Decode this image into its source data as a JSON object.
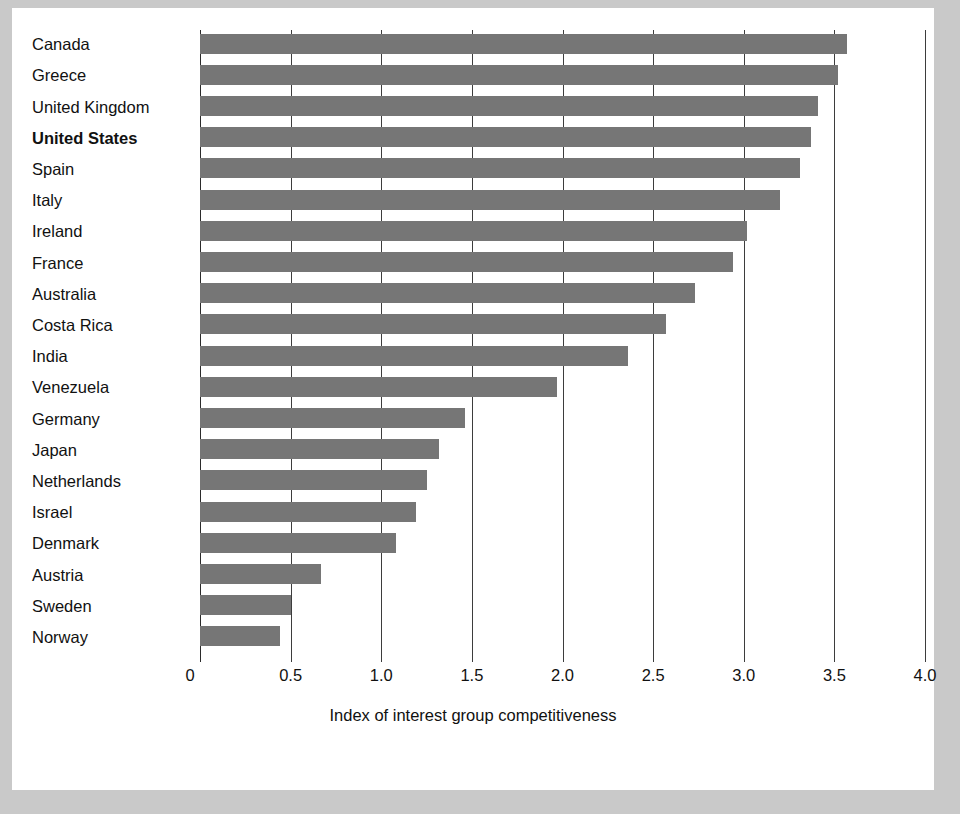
{
  "figure": {
    "background": "#ffffff",
    "page_background": "#c9c9c9",
    "bar_color": "#767676",
    "axis_color": "#2b2b2b",
    "highlight_label": "United States"
  },
  "chart_data": {
    "type": "bar",
    "orientation": "horizontal",
    "title": "",
    "subtitle": "",
    "xlabel": "Index of interest group competitiveness",
    "ylabel": "",
    "xlim": [
      0,
      4.0
    ],
    "xticks": [
      0,
      0.5,
      1.0,
      1.5,
      2.0,
      2.5,
      3.0,
      3.5,
      4.0
    ],
    "xtick_labels": [
      "0",
      "0.5",
      "1.0",
      "1.5",
      "2.0",
      "2.5",
      "3.0",
      "3.5",
      "4.0"
    ],
    "grid": true,
    "grid_axis": "x",
    "legend": false,
    "legend_position": "none",
    "categories": [
      "Canada",
      "Greece",
      "United Kingdom",
      "United States",
      "Spain",
      "Italy",
      "Ireland",
      "France",
      "Australia",
      "Costa Rica",
      "India",
      "Venezuela",
      "Germany",
      "Japan",
      "Netherlands",
      "Israel",
      "Denmark",
      "Austria",
      "Sweden",
      "Norway"
    ],
    "values": [
      3.57,
      3.52,
      3.41,
      3.37,
      3.31,
      3.2,
      3.02,
      2.94,
      2.73,
      2.57,
      2.36,
      1.97,
      1.46,
      1.32,
      1.25,
      1.19,
      1.08,
      0.67,
      0.5,
      0.44
    ],
    "highlighted_categories": [
      "United States"
    ]
  }
}
